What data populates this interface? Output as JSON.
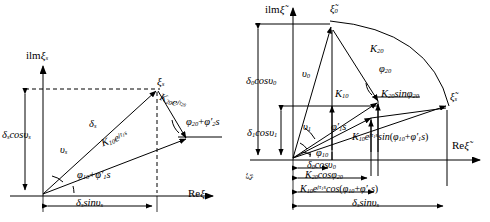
{
  "figure": {
    "type": "phasor-vector-diagram-pair"
  },
  "left_diagram": {
    "axis_imag": "ilm",
    "axis_imag_sym": "ξ",
    "axis_imag_sub": "s",
    "axis_real": "Re",
    "axis_real_sym": "ξ",
    "tip_label_sym": "ξ",
    "tip_label_sub": "s",
    "vector_delta": "δ",
    "vector_delta_sub": "s",
    "vertical_projection": "δ",
    "vertical_projection_sub": "s",
    "vertical_projection_fn": "cos",
    "vertical_projection_ang": "υ",
    "vertical_projection_ang_sub": "s",
    "horizontal_projection": "δ",
    "horizontal_projection_sub": "s",
    "horizontal_projection_fn": "sin",
    "horizontal_projection_ang": "υ",
    "horizontal_projection_ang_sub": "s",
    "angle_v": "υ",
    "angle_v_sub": "s",
    "k1_mag": "K",
    "k1_sub": "10",
    "k1_exp_base": "e",
    "k1_exp": "jτ",
    "k1_exp_sub": "1",
    "k1_exp_tail": "s",
    "k2_mag": "K",
    "k2_sub": "20",
    "k2_exp_base": "e",
    "k2_exp": "jτ",
    "k2_exp_sub": "2",
    "k2_exp_tail": "s",
    "phase1": "φ",
    "phase1_sub": "10",
    "phase1_plus": "+",
    "phase1_prime": "φ′",
    "phase1_prime_sub": "1",
    "phase1_tail": "s",
    "phase2": "φ",
    "phase2_sub": "20",
    "phase2_plus": "+",
    "phase2_prime": "φ′",
    "phase2_prime_sub": "2",
    "phase2_tail": "s"
  },
  "right_diagram": {
    "axis_imag": "ilm",
    "axis_imag_sym": "ξ̃",
    "axis_real": "Re",
    "axis_real_sym": "ξ̃",
    "tip_top_sym": "ξ̃",
    "tip_top_sub": "0",
    "tip_right_sym": "ξ̃",
    "tip_right_sub": "s",
    "delta0_cos": "δ",
    "delta0_cos_sub": "0",
    "delta0_cos_fn": "cos",
    "delta0_cos_ang": "υ",
    "delta0_cos_ang_sub": "0",
    "delta1_cos": "δ",
    "delta1_cos_sub": "1",
    "delta1_cos_fn": "cos",
    "delta1_cos_ang": "υ",
    "delta1_cos_ang_sub": "1",
    "angle_v0": "υ",
    "angle_v0_sub": "0",
    "angle_v1": "υ",
    "angle_v1_sub": "1",
    "phi1_prime_s": "φ′",
    "phi1_prime_s_sub": "1",
    "phi1_prime_s_tail": "s",
    "phi10": "φ",
    "phi10_sub": "10",
    "phi20": "φ",
    "phi20_sub": "20",
    "k10": "K",
    "k10_sub": "10",
    "k20": "K",
    "k20_sub": "20",
    "k20_sin": "K",
    "k20_sin_sub": "20",
    "k20_sin_fn": "sin",
    "k20_sin_ang": "φ",
    "k20_sin_ang_sub": "20",
    "k10_exp_sin_mag": "K",
    "k10_exp_sin_mag_sub": "10",
    "k10_exp_sin_e": "e",
    "k10_exp_sin_exp": "jτ",
    "k10_exp_sin_exp_sub": "1",
    "k10_exp_sin_exp_tail": "s",
    "k10_exp_sin_fn": "sin",
    "k10_exp_sin_arg_open": "(",
    "k10_exp_sin_a": "φ",
    "k10_exp_sin_a_sub": "10",
    "k10_exp_sin_plus": "+",
    "k10_exp_sin_b": "φ′",
    "k10_exp_sin_b_sub": "1",
    "k10_exp_sin_b_tail": "s",
    "k10_exp_sin_arg_close": ")",
    "bottom_delta0_cos": "δ",
    "bottom_delta0_cos_sub": "0",
    "bottom_delta0_cos_fn": "cos",
    "bottom_delta0_cos_ang": "υ",
    "bottom_delta0_cos_ang_sub": "0",
    "bottom_k20_cos": "K",
    "bottom_k20_cos_sub": "20",
    "bottom_k20_cos_fn": "cos",
    "bottom_k20_cos_ang": "φ",
    "bottom_k20_cos_ang_sub": "20",
    "bottom_k10_exp_cos_mag": "K",
    "bottom_k10_exp_cos_mag_sub": "10",
    "bottom_k10_exp_cos_e": "e",
    "bottom_k10_exp_cos_exp": "jτ",
    "bottom_k10_exp_cos_exp_sub": "1",
    "bottom_k10_exp_cos_exp_tail": "s",
    "bottom_k10_exp_cos_fn": "cos",
    "bottom_k10_exp_cos_open": "(",
    "bottom_k10_exp_cos_a": "φ",
    "bottom_k10_exp_cos_a_sub": "10",
    "bottom_k10_exp_cos_plus": "+",
    "bottom_k10_exp_cos_b": "φ′",
    "bottom_k10_exp_cos_b_sub": "1",
    "bottom_k10_exp_cos_b_tail": "s",
    "bottom_k10_exp_cos_close": ")",
    "bottom_delta_s_sin": "δ",
    "bottom_delta_s_sin_sub": "s",
    "bottom_delta_s_sin_fn": "sin",
    "bottom_delta_s_sin_ang": "υ",
    "bottom_delta_s_sin_ang_sub": "s",
    "edge_sym": "ξ̃",
    "edge_sub": "s"
  },
  "style": {
    "stroke": "#000000",
    "background": "#ffffff"
  }
}
